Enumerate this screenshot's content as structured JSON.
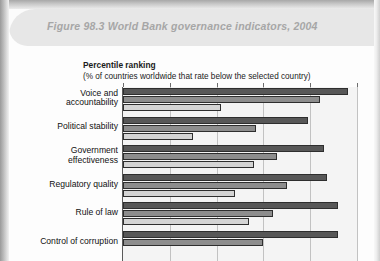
{
  "figure": {
    "title": "Figure 98.3  World Bank governance indicators, 2004",
    "header_bg": "#e7e7e7",
    "title_color": "#a6a6a6"
  },
  "subtitle": {
    "main": "Percentile ranking",
    "sub": "(% of countries worldwide that rate below the selected country)"
  },
  "chart_data": {
    "type": "bar",
    "orientation": "horizontal",
    "title": "World Bank governance indicators, 2004",
    "subtitle": "Percentile ranking (% of countries worldwide that rate below the selected country)",
    "xlabel": "Percentile ranking",
    "ylabel": "",
    "xlim": [
      0,
      100
    ],
    "xticks": [
      0,
      20,
      40,
      60,
      80,
      100
    ],
    "grid": true,
    "legend": "none",
    "categories": [
      "Voice and accountability",
      "Political stability",
      "Government effectiveness",
      "Regulatory quality",
      "Rule of law",
      "Control of corruption"
    ],
    "category_lines": [
      [
        "Voice and",
        "accountability"
      ],
      [
        "Political stability"
      ],
      [
        "Government",
        "effectiveness"
      ],
      [
        "Regulatory quality"
      ],
      [
        "Rule of law"
      ],
      [
        "Control of corruption"
      ]
    ],
    "series": [
      {
        "name": "series-1",
        "color": "#575757",
        "values": [
          96,
          79,
          86,
          87,
          92,
          92
        ]
      },
      {
        "name": "series-2",
        "color": "#8d8d8d",
        "values": [
          84,
          57,
          66,
          70,
          64,
          60
        ]
      },
      {
        "name": "series-3",
        "color": "#d4d4d4",
        "values": [
          42,
          30,
          56,
          48,
          54,
          null
        ]
      }
    ],
    "note": "Bottom of chart is cropped; third bar of 'Control of corruption' is not visible."
  }
}
